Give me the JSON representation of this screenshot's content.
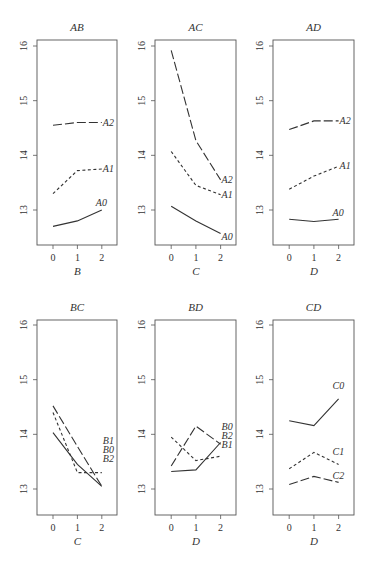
{
  "chart_data": [
    {
      "type": "line",
      "title": "AB",
      "xlabel": "B",
      "ylabel": "",
      "x": [
        0,
        1,
        2
      ],
      "ylim": [
        12.4,
        16.1
      ],
      "yticks": [
        13,
        14,
        15,
        16
      ],
      "series": [
        {
          "name": "A0",
          "style": "solid",
          "values": [
            12.7,
            12.8,
            13.0
          ]
        },
        {
          "name": "A1",
          "style": "short-dash",
          "values": [
            13.3,
            13.72,
            13.75
          ]
        },
        {
          "name": "A2",
          "style": "long-dash",
          "values": [
            14.55,
            14.6,
            14.6
          ]
        }
      ]
    },
    {
      "type": "line",
      "title": "AC",
      "xlabel": "C",
      "ylabel": "",
      "x": [
        0,
        1,
        2
      ],
      "ylim": [
        12.4,
        16.1
      ],
      "yticks": [
        13,
        14,
        15,
        16
      ],
      "series": [
        {
          "name": "A0",
          "style": "solid",
          "values": [
            13.07,
            12.8,
            12.57
          ]
        },
        {
          "name": "A1",
          "style": "short-dash",
          "values": [
            14.07,
            13.45,
            13.28
          ]
        },
        {
          "name": "A2",
          "style": "long-dash",
          "values": [
            15.92,
            14.27,
            13.55
          ]
        }
      ]
    },
    {
      "type": "line",
      "title": "AD",
      "xlabel": "D",
      "ylabel": "",
      "x": [
        0,
        1,
        2
      ],
      "ylim": [
        12.4,
        16.1
      ],
      "yticks": [
        13,
        14,
        15,
        16
      ],
      "series": [
        {
          "name": "A0",
          "style": "solid",
          "values": [
            12.83,
            12.79,
            12.83
          ]
        },
        {
          "name": "A1",
          "style": "short-dash",
          "values": [
            13.38,
            13.62,
            13.8
          ]
        },
        {
          "name": "A2",
          "style": "long-dash",
          "values": [
            14.47,
            14.63,
            14.63
          ]
        }
      ]
    },
    {
      "type": "line",
      "title": "BC",
      "xlabel": "C",
      "ylabel": "",
      "x": [
        0,
        1,
        2
      ],
      "ylim": [
        12.4,
        16.1
      ],
      "yticks": [
        13,
        14,
        15,
        16
      ],
      "series": [
        {
          "name": "B0",
          "style": "solid",
          "values": [
            14.03,
            13.45,
            13.05
          ]
        },
        {
          "name": "B1",
          "style": "short-dash",
          "values": [
            14.4,
            13.3,
            13.3
          ]
        },
        {
          "name": "B2",
          "style": "long-dash",
          "values": [
            14.52,
            13.78,
            13.05
          ]
        }
      ]
    },
    {
      "type": "line",
      "title": "BD",
      "xlabel": "D",
      "ylabel": "",
      "x": [
        0,
        1,
        2
      ],
      "ylim": [
        12.4,
        16.1
      ],
      "yticks": [
        13,
        14,
        15,
        16
      ],
      "series": [
        {
          "name": "B0",
          "style": "solid",
          "values": [
            13.32,
            13.35,
            13.85
          ]
        },
        {
          "name": "B1",
          "style": "short-dash",
          "values": [
            13.95,
            13.52,
            13.6
          ]
        },
        {
          "name": "B2",
          "style": "long-dash",
          "values": [
            13.42,
            14.15,
            13.82
          ]
        }
      ]
    },
    {
      "type": "line",
      "title": "CD",
      "xlabel": "D",
      "ylabel": "",
      "x": [
        0,
        1,
        2
      ],
      "ylim": [
        12.4,
        16.1
      ],
      "yticks": [
        13,
        14,
        15,
        16
      ],
      "series": [
        {
          "name": "C0",
          "style": "solid",
          "values": [
            14.25,
            14.16,
            14.65
          ]
        },
        {
          "name": "C1",
          "style": "short-dash",
          "values": [
            13.37,
            13.67,
            13.45
          ]
        },
        {
          "name": "C2",
          "style": "long-dash",
          "values": [
            13.08,
            13.23,
            13.12
          ]
        }
      ]
    }
  ]
}
